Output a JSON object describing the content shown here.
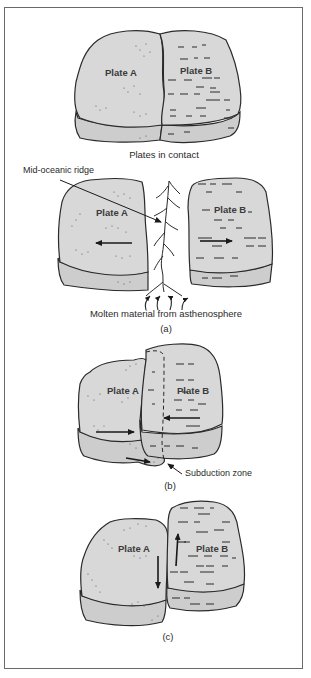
{
  "figure": {
    "colors": {
      "plate_fill": "#d8d8d8",
      "plate_side_fill": "#cdcdcd",
      "outline": "#2a2a2a",
      "frame": "#6a6a6a",
      "background": "#ffffff"
    },
    "panels": [
      {
        "id": "contact",
        "caption": "Plates in contact",
        "plate_a_label": "Plate A",
        "plate_b_label": "Plate B"
      },
      {
        "id": "a",
        "caption": "(a)",
        "plate_a_label": "Plate A",
        "plate_b_label": "Plate B",
        "ridge_label": "Mid-oceanic ridge",
        "source_label": "Molten material from asthenosphere",
        "motion": "divergent"
      },
      {
        "id": "b",
        "caption": "(b)",
        "plate_a_label": "Plate A",
        "plate_b_label": "Plate B",
        "zone_label": "Subduction zone",
        "motion": "convergent"
      },
      {
        "id": "c",
        "caption": "(c)",
        "plate_a_label": "Plate A",
        "plate_b_label": "Plate B",
        "motion": "transform"
      }
    ]
  }
}
